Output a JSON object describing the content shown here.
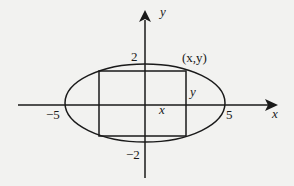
{
  "diagram": {
    "axes": {
      "x_label": "x",
      "y_label": "y"
    },
    "ticks": {
      "x_neg": "−5",
      "x_pos": "5",
      "y_pos": "2",
      "y_neg": "−2"
    },
    "labels": {
      "point": "(x,y)",
      "rect_half_width": "x",
      "rect_half_height": "y"
    },
    "shapes": {
      "ellipse": {
        "semi_major": 5,
        "semi_minor": 2
      },
      "inscribed_rectangle": "corner at (x,y)"
    },
    "colors": {
      "stroke": "#1a1a1a",
      "background": "#f2f2f0"
    }
  }
}
